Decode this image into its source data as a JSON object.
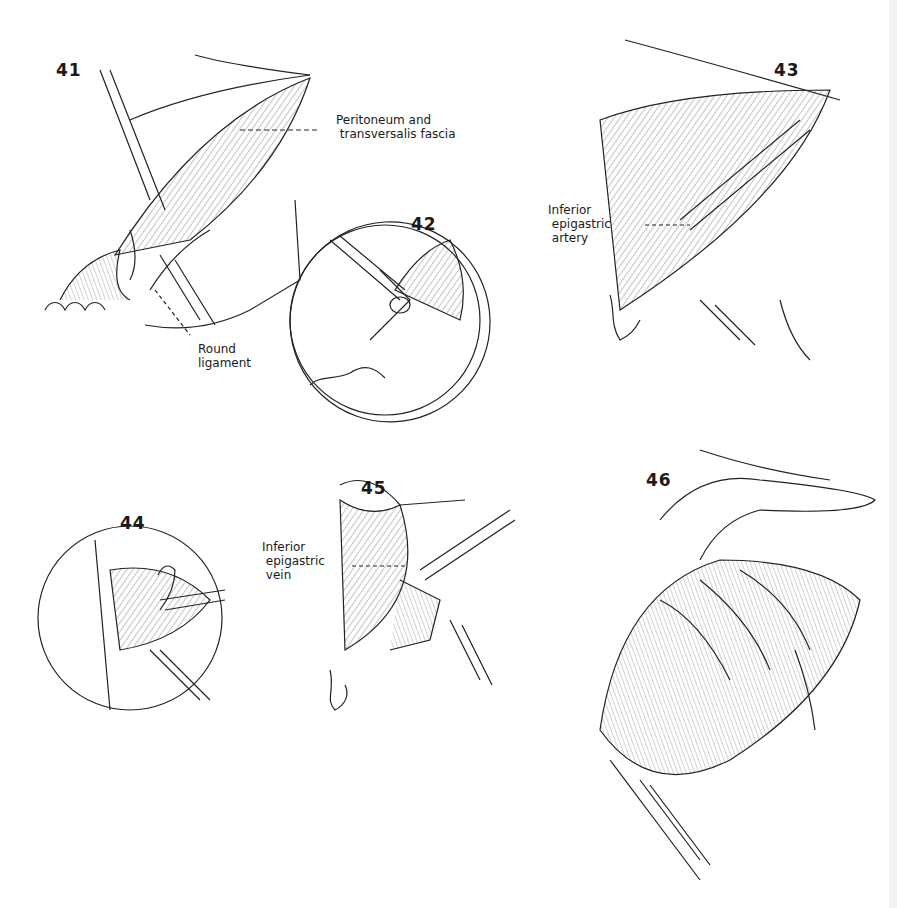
{
  "figures": [
    {
      "number": "41",
      "labels": [
        "Peritoneum and\n transversalis fascia",
        "Round\nligament"
      ]
    },
    {
      "number": "42",
      "labels": []
    },
    {
      "number": "43",
      "labels": [
        "Inferior\n epigastric\n artery"
      ]
    },
    {
      "number": "44",
      "labels": []
    },
    {
      "number": "45",
      "labels": [
        "Inferior\n epigastric\n vein"
      ]
    },
    {
      "number": "46",
      "labels": []
    }
  ]
}
